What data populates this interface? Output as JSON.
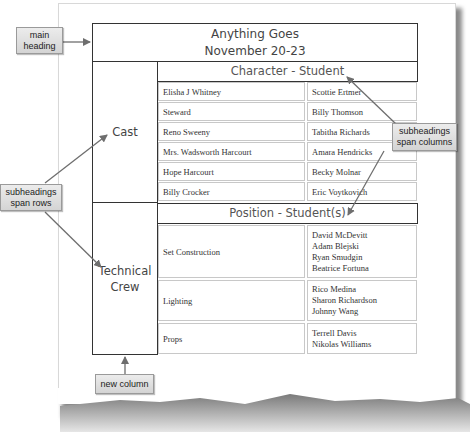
{
  "table": {
    "main_heading": {
      "line1": "Anything Goes",
      "line2": "November 20-23"
    },
    "row_groups": [
      {
        "label": "Cast",
        "subheading": "Character - Student",
        "rows": [
          {
            "left": "Elisha J Whitney",
            "right": [
              "Scottie Ertmer"
            ]
          },
          {
            "left": "Steward",
            "right": [
              "Billy Thomson"
            ]
          },
          {
            "left": "Reno Sweeny",
            "right": [
              "Tabitha Richards"
            ]
          },
          {
            "left": "Mrs. Wadsworth Harcourt",
            "right": [
              "Amara Hendricks"
            ]
          },
          {
            "left": "Hope Harcourt",
            "right": [
              "Becky Molnar"
            ]
          },
          {
            "left": "Billy Crocker",
            "right": [
              "Eric Voytkovich"
            ]
          }
        ]
      },
      {
        "label_line1": "Technical",
        "label_line2": "Crew",
        "subheading": "Position - Student(s)",
        "rows": [
          {
            "left": "Set Construction",
            "right": [
              "David McDevitt",
              "Adam Blejski",
              "Ryan Smudgin",
              "Beatrice Fortuna"
            ]
          },
          {
            "left": "Lighting",
            "right": [
              "Rico Medina",
              "Sharon Richardson",
              "Johnny Wang"
            ]
          },
          {
            "left": "Props",
            "right": [
              "Terrell Davis",
              "Nikolas Williams"
            ]
          }
        ]
      }
    ]
  },
  "callouts": {
    "main_heading": {
      "line1": "main",
      "line2": "heading"
    },
    "subheadings_rows": {
      "line1": "subheadings",
      "line2": "span rows"
    },
    "subheadings_columns": {
      "line1": "subheadings",
      "line2": "span columns"
    },
    "new_column": {
      "line1": "new column"
    }
  },
  "colors": {
    "table_border": "#333333",
    "cell_border": "#c8c8c8",
    "callout_fill": "#dcdcdc",
    "arrow": "#6e6e6e",
    "shadow": "#8a8a8a"
  }
}
